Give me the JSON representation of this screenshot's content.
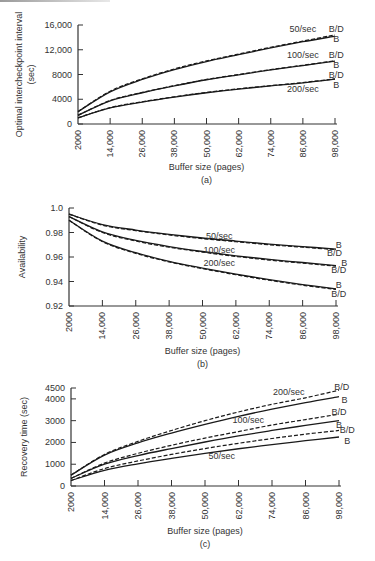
{
  "chart_data": [
    {
      "id": "a",
      "type": "line",
      "caption": "(a)",
      "title": "",
      "xlabel": "Buffer size (pages)",
      "ylabel": "Optimal intercheckpoint interval",
      "ylabel2": "(sec)",
      "x": [
        2000,
        14000,
        26000,
        38000,
        50000,
        62000,
        74000,
        86000,
        98000
      ],
      "x_tick_labels": [
        "2000",
        "14,000",
        "26,000",
        "38,000",
        "50,000",
        "62,000",
        "74,000",
        "86,000",
        "98,000"
      ],
      "y_ticks": [
        0,
        4000,
        8000,
        12000,
        16000
      ],
      "y_tick_labels": [
        "0",
        "4000",
        "8000",
        "12,000",
        "16,000"
      ],
      "xlim": [
        2000,
        98000
      ],
      "ylim": [
        0,
        16000
      ],
      "grid": false,
      "series": [
        {
          "name": "50/sec B/D",
          "rate": "50/sec",
          "variant": "B/D",
          "dashed": true,
          "values": [
            2000,
            5300,
            7300,
            8900,
            10200,
            11300,
            12400,
            13400,
            14400
          ]
        },
        {
          "name": "50/sec B",
          "rate": "50/sec",
          "variant": "B",
          "dashed": false,
          "values": [
            2000,
            5200,
            7200,
            8800,
            10100,
            11200,
            12300,
            13300,
            14200
          ]
        },
        {
          "name": "100/sec B/D",
          "rate": "100/sec",
          "variant": "B/D",
          "dashed": true,
          "values": [
            1400,
            3800,
            5100,
            6200,
            7200,
            8000,
            8800,
            9500,
            10200
          ]
        },
        {
          "name": "100/sec B",
          "rate": "100/sec",
          "variant": "B",
          "dashed": false,
          "values": [
            1400,
            3750,
            5050,
            6150,
            7150,
            7950,
            8750,
            9450,
            10150
          ]
        },
        {
          "name": "200/sec B/D",
          "rate": "200/sec",
          "variant": "B/D",
          "dashed": true,
          "values": [
            1000,
            2650,
            3600,
            4400,
            5100,
            5700,
            6200,
            6700,
            7300
          ]
        },
        {
          "name": "200/sec B",
          "rate": "200/sec",
          "variant": "B",
          "dashed": false,
          "values": [
            1000,
            2600,
            3550,
            4350,
            5050,
            5650,
            6150,
            6650,
            7250
          ]
        }
      ],
      "annotations": [
        {
          "text": "50/sec",
          "x": 86000,
          "y": 15300
        },
        {
          "text": "B/D",
          "x": 98500,
          "y": 15300
        },
        {
          "text": "B",
          "x": 98500,
          "y": 13700
        },
        {
          "text": "100/sec",
          "x": 86000,
          "y": 11100
        },
        {
          "text": "B/D",
          "x": 98500,
          "y": 11100
        },
        {
          "text": "B",
          "x": 98500,
          "y": 9500
        },
        {
          "text": "B/D",
          "x": 98500,
          "y": 7900
        },
        {
          "text": "B",
          "x": 98500,
          "y": 6300
        },
        {
          "text": "200/sec",
          "x": 86000,
          "y": 5700
        }
      ]
    },
    {
      "id": "b",
      "type": "line",
      "caption": "(b)",
      "title": "",
      "xlabel": "Buffer size (pages)",
      "ylabel": "Availability",
      "ylabel2": "",
      "x": [
        2000,
        14000,
        26000,
        38000,
        50000,
        62000,
        74000,
        86000,
        98000
      ],
      "x_tick_labels": [
        "2000",
        "14,000",
        "26,000",
        "38,000",
        "50,000",
        "62,000",
        "74,000",
        "86,000",
        "98,000"
      ],
      "y_ticks": [
        0.92,
        0.94,
        0.96,
        0.98,
        1.0
      ],
      "y_tick_labels": [
        "0.92",
        "0.94",
        "0.96",
        "0.98",
        "1.0"
      ],
      "xlim": [
        2000,
        98000
      ],
      "ylim": [
        0.92,
        1.0
      ],
      "grid": false,
      "series": [
        {
          "name": "50/sec B",
          "rate": "50/sec",
          "variant": "B",
          "dashed": false,
          "values": [
            0.995,
            0.9865,
            0.982,
            0.9785,
            0.9755,
            0.973,
            0.9705,
            0.9685,
            0.9665
          ]
        },
        {
          "name": "50/sec B/D",
          "rate": "50/sec",
          "variant": "B/D",
          "dashed": true,
          "values": [
            0.995,
            0.986,
            0.9815,
            0.978,
            0.975,
            0.9725,
            0.97,
            0.968,
            0.966
          ]
        },
        {
          "name": "100/sec B",
          "rate": "100/sec",
          "variant": "B",
          "dashed": false,
          "values": [
            0.993,
            0.9805,
            0.9735,
            0.9685,
            0.9645,
            0.961,
            0.958,
            0.9555,
            0.953
          ]
        },
        {
          "name": "100/sec B/D",
          "rate": "100/sec",
          "variant": "B/D",
          "dashed": true,
          "values": [
            0.993,
            0.98,
            0.973,
            0.968,
            0.964,
            0.9605,
            0.9575,
            0.955,
            0.9525
          ]
        },
        {
          "name": "200/sec B",
          "rate": "200/sec",
          "variant": "B",
          "dashed": false,
          "values": [
            0.99,
            0.973,
            0.9635,
            0.9565,
            0.951,
            0.946,
            0.9415,
            0.9375,
            0.934
          ]
        },
        {
          "name": "200/sec B/D",
          "rate": "200/sec",
          "variant": "B/D",
          "dashed": true,
          "values": [
            0.99,
            0.9725,
            0.963,
            0.956,
            0.9505,
            0.9455,
            0.941,
            0.937,
            0.9335
          ]
        }
      ],
      "annotations": [
        {
          "text": "50/sec",
          "x": 56000,
          "y": 0.977
        },
        {
          "text": "B",
          "x": 99000,
          "y": 0.9695
        },
        {
          "text": "B/D",
          "x": 97500,
          "y": 0.9635
        },
        {
          "text": "100/sec",
          "x": 56000,
          "y": 0.966
        },
        {
          "text": "B",
          "x": 101000,
          "y": 0.955
        },
        {
          "text": "B/D",
          "x": 99000,
          "y": 0.949
        },
        {
          "text": "200/sec",
          "x": 56000,
          "y": 0.955
        },
        {
          "text": "B",
          "x": 99000,
          "y": 0.937
        },
        {
          "text": "B/D",
          "x": 99000,
          "y": 0.93
        }
      ]
    },
    {
      "id": "c",
      "type": "line",
      "caption": "(c)",
      "title": "",
      "xlabel": "Buffer size (pages)",
      "ylabel": "Recovery time (sec)",
      "ylabel2": "",
      "x": [
        2000,
        14000,
        26000,
        38000,
        50000,
        62000,
        74000,
        86000,
        98000
      ],
      "x_tick_labels": [
        "2000",
        "14,000",
        "26,000",
        "38,000",
        "50,000",
        "62,000",
        "74,000",
        "86,000",
        "98,000"
      ],
      "y_ticks": [
        0,
        1000,
        2000,
        3000,
        4000,
        4500
      ],
      "y_tick_labels": [
        "0",
        "1000",
        "2000",
        "3000",
        "4000",
        "4500"
      ],
      "xlim": [
        2000,
        98000
      ],
      "ylim": [
        0,
        4500
      ],
      "grid": false,
      "series": [
        {
          "name": "200/sec B/D",
          "rate": "200/sec",
          "variant": "B/D",
          "dashed": true,
          "values": [
            500,
            1450,
            2050,
            2550,
            3000,
            3400,
            3750,
            4050,
            4400
          ]
        },
        {
          "name": "200/sec B",
          "rate": "200/sec",
          "variant": "B",
          "dashed": false,
          "values": [
            500,
            1420,
            1980,
            2430,
            2830,
            3200,
            3530,
            3830,
            4100
          ]
        },
        {
          "name": "100/sec B/D",
          "rate": "100/sec",
          "variant": "B/D",
          "dashed": true,
          "values": [
            350,
            1050,
            1500,
            1870,
            2200,
            2500,
            2800,
            3050,
            3300
          ]
        },
        {
          "name": "100/sec B",
          "rate": "100/sec",
          "variant": "B",
          "dashed": false,
          "values": [
            350,
            1000,
            1400,
            1720,
            2020,
            2300,
            2550,
            2780,
            3000
          ]
        },
        {
          "name": "50/sec B/D",
          "rate": "50/sec",
          "variant": "B/D",
          "dashed": true,
          "values": [
            250,
            800,
            1150,
            1450,
            1720,
            1960,
            2180,
            2380,
            2550
          ]
        },
        {
          "name": "50/sec B",
          "rate": "50/sec",
          "variant": "B",
          "dashed": false,
          "values": [
            250,
            720,
            1020,
            1270,
            1500,
            1710,
            1900,
            2080,
            2250
          ]
        }
      ],
      "annotations": [
        {
          "text": "200/sec",
          "x": 80000,
          "y": 4300
        },
        {
          "text": "B/D",
          "x": 99000,
          "y": 4550
        },
        {
          "text": "B",
          "x": 100000,
          "y": 3950
        },
        {
          "text": "100/sec",
          "x": 65500,
          "y": 3050
        },
        {
          "text": "B/D",
          "x": 98000,
          "y": 3400
        },
        {
          "text": "B",
          "x": 98000,
          "y": 2800
        },
        {
          "text": "B/D",
          "x": 101000,
          "y": 2550
        },
        {
          "text": "B",
          "x": 101000,
          "y": 2050
        },
        {
          "text": "50/sec",
          "x": 56000,
          "y": 1400
        }
      ]
    }
  ],
  "layout": {
    "panels": [
      {
        "left": 78,
        "right": 335,
        "top": 25,
        "bottom": 124,
        "xlabel_y": 170,
        "caption_y": 183,
        "ylabel_x": 22,
        "ylabel2_x": 34
      },
      {
        "left": 69,
        "right": 336,
        "top": 208,
        "bottom": 306,
        "xlabel_y": 354,
        "caption_y": 367,
        "ylabel_x": 25,
        "ylabel2_x": 0
      },
      {
        "left": 71,
        "right": 339,
        "top": 388,
        "bottom": 486,
        "xlabel_y": 534,
        "caption_y": 547,
        "ylabel_x": 27,
        "ylabel2_x": 0
      }
    ]
  }
}
